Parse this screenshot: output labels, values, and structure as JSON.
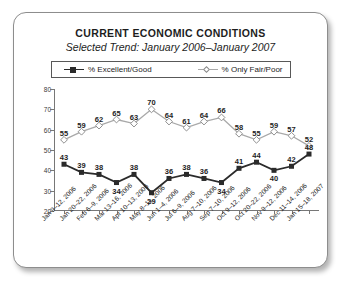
{
  "card": {
    "title": "CURRENT ECONOMIC CONDITIONS",
    "subtitle": "Selected Trend: January 2006–January 2007"
  },
  "legend": {
    "series1_label": "% Excellent/Good",
    "series2_label": "% Only Fair/Poor",
    "series1_marker": "filled-square-marker",
    "series2_marker": "open-diamond-marker"
  },
  "colors": {
    "series1": "#2b2b2b",
    "series2": "#a9a9a9",
    "axis": "#777777",
    "border": "#8d8d8d",
    "text": "#1d1d1d"
  },
  "chart_data": {
    "type": "line",
    "title": "CURRENT ECONOMIC CONDITIONS",
    "subtitle": "Selected Trend: January 2006–January 2007",
    "xlabel": "",
    "ylabel": "",
    "ylim": [
      20,
      80
    ],
    "yticks": [
      20,
      30,
      40,
      50,
      60,
      70,
      80
    ],
    "grid": false,
    "legend_position": "top",
    "categories": [
      "Jan 9–12, 2006",
      "Jan 20–22, 2006",
      "Feb 6–9, 2006",
      "Mar 13–16, 2006",
      "Apr 10–13, 2006",
      "May 8–11, 2006",
      "Jun 1–4, 2006",
      "Jul 6–9, 2006",
      "Aug 7–10, 2006",
      "Sep 7–10, 2006",
      "Oct 9–12, 2006",
      "Oct 20–22, 2006",
      "Nov 9–12, 2006",
      "Dec 11–14, 2006",
      "Jan 15–18, 2007"
    ],
    "series": [
      {
        "name": "% Excellent/Good",
        "values": [
          43,
          39,
          38,
          34,
          38,
          29,
          36,
          38,
          36,
          34,
          41,
          44,
          40,
          42,
          48
        ]
      },
      {
        "name": "% Only Fair/Poor",
        "values": [
          55,
          59,
          62,
          65,
          63,
          70,
          64,
          61,
          64,
          66,
          58,
          55,
          59,
          57,
          52
        ]
      }
    ]
  }
}
